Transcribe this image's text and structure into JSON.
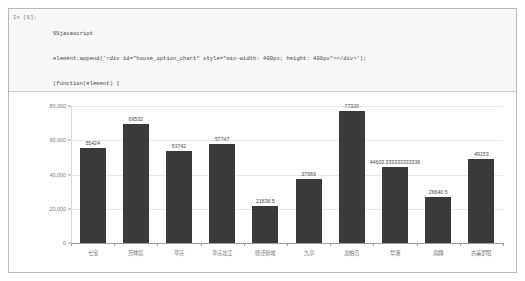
{
  "notebook": {
    "prompt": "In [6]:",
    "code_lines": [
      "%%javascript",
      "element.append('<div id=\"house_option_chart\" style=\"min-width: 400px; height: 400px\"></div>');",
      "(function(element) {",
      "    requirejs(['echarts'], function(echarts) {",
      "        var myChart = echarts.init(document.getElementById('house_option_chart'));",
      "        myChart.setOption(house_option);",
      "        return [];",
      "    });",
      "})(element);"
    ]
  },
  "chart_data": {
    "type": "bar",
    "title": "",
    "xlabel": "",
    "ylabel": "",
    "ylim": [
      0,
      80000
    ],
    "grid": true,
    "legend": null,
    "bar_color": "#3a3a3a",
    "categories": [
      "七宝",
      "万体馆",
      "莘庄",
      "莘庄北江",
      "徐泾新城",
      "九亭",
      "龙柏沿",
      "华漕",
      "南翔",
      "古美罗阳"
    ],
    "values": [
      55424,
      69532,
      53742,
      57747,
      21636.5,
      37669,
      77320,
      44603.333333333336,
      26640.5,
      49153
    ],
    "value_labels": [
      "55424",
      "69532",
      "53742",
      "57747",
      "21636.5",
      "37669",
      "77320",
      "44603.333333333336",
      "26640.5",
      "49153"
    ],
    "ytick_values": [
      0,
      20000,
      40000,
      60000,
      80000
    ],
    "ytick_labels": [
      "0",
      "20,000",
      "40,000",
      "60,000",
      "80,000"
    ]
  }
}
